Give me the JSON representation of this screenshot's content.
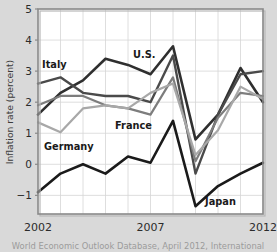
{
  "chart_data": {
    "type": "line",
    "title": "",
    "xlabel": "",
    "ylabel": "Inflation rate (percent)",
    "xlim": [
      2002,
      2012
    ],
    "ylim": [
      -1.6,
      5
    ],
    "grid": true,
    "legend_position": "inline-annotations",
    "x": [
      2002,
      2003,
      2004,
      2005,
      2006,
      2007,
      2008,
      2009,
      2010,
      2011,
      2012
    ],
    "yticks": [
      -1,
      0,
      1,
      2,
      3,
      4,
      5
    ],
    "ytick_labels": [
      "−1",
      "0",
      "1",
      "2",
      "3",
      "4",
      "5"
    ],
    "xticks": [
      2002,
      2007,
      2012
    ],
    "xtick_labels": [
      "2002",
      "2007",
      "2012"
    ],
    "series": [
      {
        "name": "U.S.",
        "color": "#2f2f2f",
        "width": 2.6,
        "values": [
          1.6,
          2.3,
          2.7,
          3.4,
          3.2,
          2.9,
          3.8,
          0.8,
          1.6,
          3.1,
          2.0
        ]
      },
      {
        "name": "Italy",
        "color": "#4a4a4a",
        "width": 2.4,
        "values": [
          2.6,
          2.8,
          2.3,
          2.2,
          2.2,
          2.0,
          3.5,
          -0.3,
          1.6,
          2.9,
          3.0
        ]
      },
      {
        "name": "France",
        "color": "#7d7d7d",
        "width": 2.2,
        "values": [
          1.9,
          2.2,
          2.2,
          1.9,
          1.8,
          1.6,
          2.8,
          0.1,
          1.5,
          2.3,
          2.2
        ]
      },
      {
        "name": "Germany",
        "color": "#a8a8a8",
        "width": 2.2,
        "values": [
          1.35,
          1.03,
          1.8,
          1.9,
          1.8,
          2.3,
          2.6,
          0.3,
          1.1,
          2.5,
          2.1
        ]
      },
      {
        "name": "Japan",
        "color": "#1a1a1a",
        "width": 2.6,
        "values": [
          -0.9,
          -0.3,
          0.0,
          -0.3,
          0.25,
          0.05,
          1.4,
          -1.35,
          -0.7,
          -0.3,
          0.05
        ]
      }
    ],
    "annotations": [
      {
        "text": "Italy",
        "x_px": 42,
        "y_px": 68,
        "name": "italy"
      },
      {
        "text": "U.S.",
        "x_px": 133,
        "y_px": 58,
        "name": "us"
      },
      {
        "text": "France",
        "x_px": 115,
        "y_px": 129,
        "name": "france"
      },
      {
        "text": "Germany",
        "x_px": 44,
        "y_px": 150,
        "name": "germany"
      },
      {
        "text": "Japan",
        "x_px": 205,
        "y_px": 205,
        "name": "japan"
      }
    ]
  },
  "caption": {
    "text": "World Economic Outlook Database, April 2012, International"
  }
}
